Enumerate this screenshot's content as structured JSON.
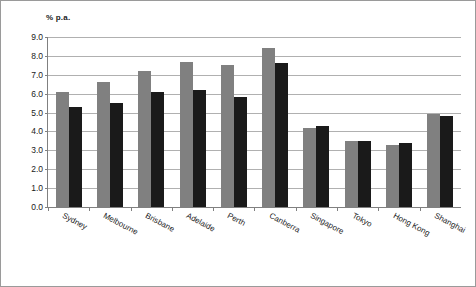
{
  "chart_data": {
    "type": "bar",
    "title": "",
    "ylabel": "% p.a.",
    "xlabel": "",
    "ylim": [
      0.0,
      9.0
    ],
    "yticks": [
      "0.0",
      "1.0",
      "2.0",
      "3.0",
      "4.0",
      "5.0",
      "6.0",
      "7.0",
      "8.0",
      "9.0"
    ],
    "grid": true,
    "legend_position": "none",
    "categories": [
      "Sydney",
      "Melbourne",
      "Brisbane",
      "Adelaide",
      "Perth",
      "Canberra",
      "Singapore",
      "Tokyo",
      "Hong Kong",
      "Shanghai"
    ],
    "series": [
      {
        "name": "Series 1",
        "color": "#808080",
        "values": [
          6.1,
          6.6,
          7.2,
          7.7,
          7.5,
          8.4,
          4.2,
          3.5,
          3.3,
          4.9
        ]
      },
      {
        "name": "Series 2",
        "color": "#1a1a1a",
        "values": [
          5.3,
          5.5,
          6.1,
          6.2,
          5.8,
          7.6,
          4.3,
          3.5,
          3.4,
          4.8
        ]
      }
    ]
  },
  "colors": {
    "series1": "#808080",
    "series2": "#1a1a1a",
    "gridline": "#b0b0b0",
    "axis": "#808080",
    "border": "#9a9a9a",
    "text": "#1a1a1a"
  }
}
